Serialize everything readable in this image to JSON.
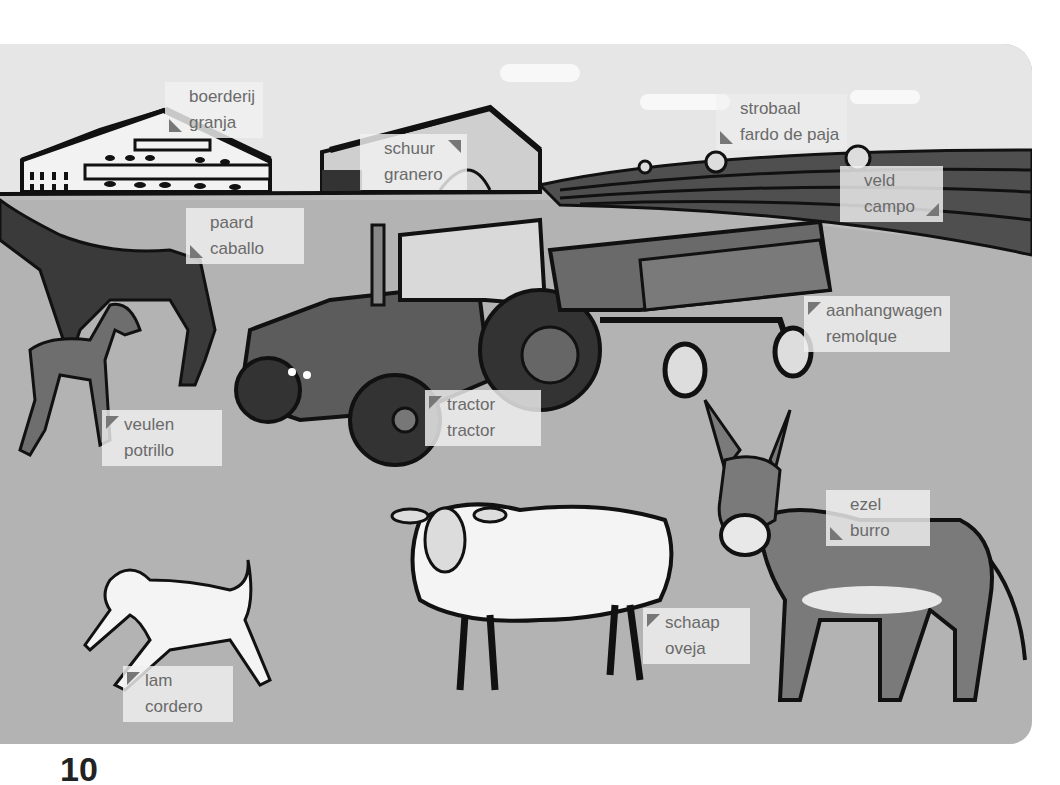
{
  "page": {
    "type": "picture dictionary",
    "theme": "farm",
    "languages": [
      "Dutch",
      "Spanish"
    ]
  },
  "labels": [
    {
      "id": "farm",
      "nl": "boerderij",
      "es": "granja",
      "marker": "bottom-left"
    },
    {
      "id": "barn",
      "nl": "schuur",
      "es": "granero",
      "marker": "top-right"
    },
    {
      "id": "bale",
      "nl": "strobaal",
      "es": "fardo de paja",
      "marker": "bottom-left"
    },
    {
      "id": "field",
      "nl": "veld",
      "es": "campo",
      "marker": "bottom-right"
    },
    {
      "id": "horse",
      "nl": "paard",
      "es": "caballo",
      "marker": "bottom-left"
    },
    {
      "id": "trailer",
      "nl": "aanhangwagen",
      "es": "remolque",
      "marker": "top-left"
    },
    {
      "id": "foal",
      "nl": "veulen",
      "es": "potrillo",
      "marker": "top-left"
    },
    {
      "id": "tractor",
      "nl": "tractor",
      "es": "tractor",
      "marker": "top-left"
    },
    {
      "id": "donkey",
      "nl": "ezel",
      "es": "burro",
      "marker": "bottom-left"
    },
    {
      "id": "sheep",
      "nl": "schaap",
      "es": "oveja",
      "marker": "top-left"
    },
    {
      "id": "lamb",
      "nl": "lam",
      "es": "cordero",
      "marker": "top-left"
    }
  ],
  "colors": {
    "ground": "#b3b3b3",
    "sky": "#e6e6e6",
    "label_bg": "#f0f0f0",
    "label_text": "#6a6a6a",
    "marker": "#777777"
  },
  "page_number_partial": "10"
}
